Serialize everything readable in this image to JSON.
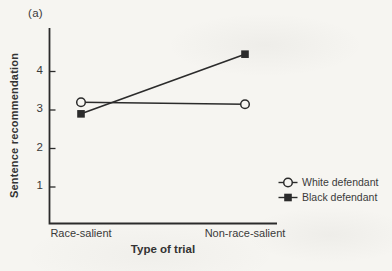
{
  "figure_label": "(a)",
  "chart_data": {
    "type": "line",
    "categories": [
      "Race-salient",
      "Non-race-salient"
    ],
    "series": [
      {
        "name": "White defendant",
        "marker": "circle-open",
        "values": [
          3.2,
          3.15
        ]
      },
      {
        "name": "Black defendant",
        "marker": "square-filled",
        "values": [
          2.9,
          4.45
        ]
      }
    ],
    "title": "",
    "xlabel": "Type of trial",
    "ylabel": "Sentence recommendation",
    "yticks": [
      1,
      2,
      3,
      4
    ],
    "ylim": [
      0,
      5.1
    ],
    "grid": false,
    "legend_position": "lower right"
  },
  "colors": {
    "paper": "#f6f5f1",
    "ink": "#2b2b2b",
    "text": "#3a3a3a"
  }
}
